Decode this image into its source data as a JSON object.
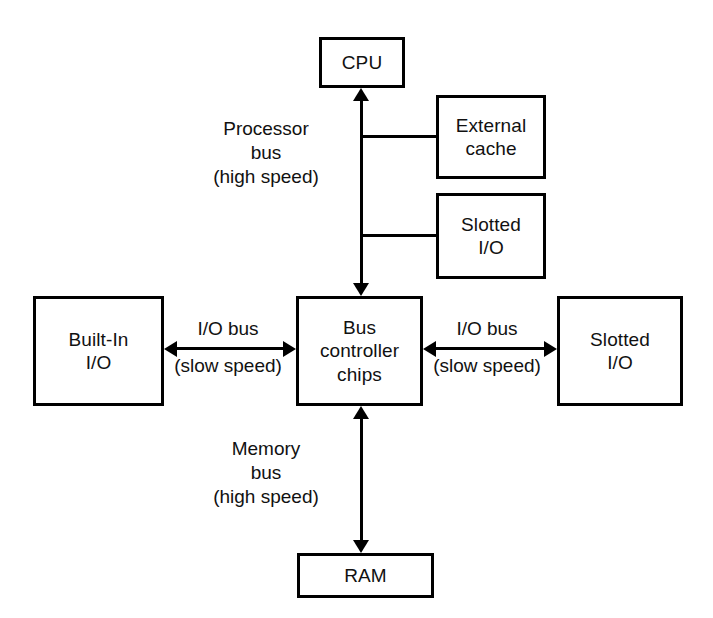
{
  "diagram": {
    "nodes": [
      {
        "id": "cpu",
        "label": "CPU"
      },
      {
        "id": "external_cache",
        "label": "External\ncache"
      },
      {
        "id": "slotted_io_top",
        "label": "Slotted\nI/O"
      },
      {
        "id": "bus_controller",
        "label": "Bus\ncontroller\nchips"
      },
      {
        "id": "builtin_io",
        "label": "Built-In\nI/O"
      },
      {
        "id": "slotted_io_right",
        "label": "Slotted\nI/O"
      },
      {
        "id": "ram",
        "label": "RAM"
      }
    ],
    "edge_labels": {
      "processor_bus": "Processor\nbus\n(high speed)",
      "memory_bus": "Memory\nbus\n(high speed)",
      "left_io_bus_name": "I/O bus",
      "left_io_bus_speed": "(slow speed)",
      "right_io_bus_name": "I/O bus",
      "right_io_bus_speed": "(slow speed)"
    },
    "colors": {
      "background": "#ffffff",
      "stroke": "#000000",
      "text": "#111111"
    }
  }
}
